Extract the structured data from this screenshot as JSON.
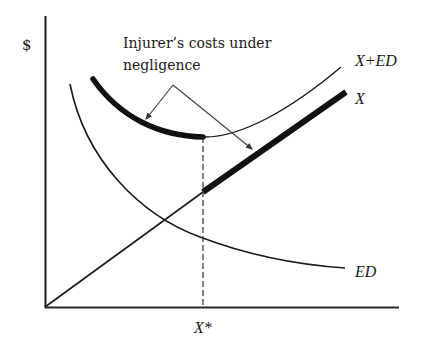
{
  "diagram": {
    "y_axis_label": "$",
    "x_axis_tick_label": "X*",
    "annotation": {
      "line1": "Injurer’s costs under",
      "line2": "negligence"
    },
    "curves": {
      "x_plus_ed": {
        "label": "X+ED"
      },
      "x": {
        "label": "X"
      },
      "ed": {
        "label": "ED"
      }
    },
    "colors": {
      "ink": "#1a1a1a",
      "background": "#ffffff"
    }
  }
}
